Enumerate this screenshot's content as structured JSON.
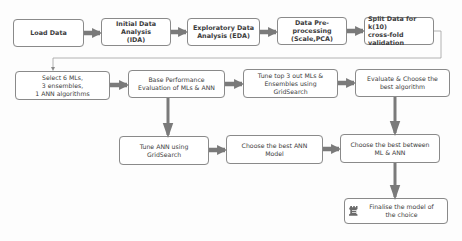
{
  "diagram": {
    "type": "flowchart",
    "colors": {
      "box_border": "#8a8a8a",
      "box_fill": "#ffffff",
      "arrow": "#7a7a7a",
      "connector": "#a0a0a0",
      "text": "#3c3c3c"
    },
    "nodes": [
      {
        "id": "load_data",
        "label": "Load Data"
      },
      {
        "id": "ida",
        "label": "Initial Data Analysis\n(IDA)"
      },
      {
        "id": "eda",
        "label": "Exploratory Data\nAnalysis (EDA)"
      },
      {
        "id": "preprocessing",
        "label": "Data Pre-processing\n(Scale,PCA)"
      },
      {
        "id": "split",
        "label": "Split Data for k(10)\ncross-fold validation"
      },
      {
        "id": "select",
        "label": "Select 6 MLs,\n3 ensembles,\n1 ANN algorithms"
      },
      {
        "id": "base_perf",
        "label": "Base Performance\nEvaluation of MLs & ANN"
      },
      {
        "id": "tune_top3",
        "label": "Tune top 3 out MLs &\nEnsembles using GridSearch"
      },
      {
        "id": "evaluate",
        "label": "Evaluate & Choose the\nbest algorithm"
      },
      {
        "id": "tune_ann",
        "label": "Tune ANN using\nGridSearch"
      },
      {
        "id": "choose_ann",
        "label": "Choose the best ANN\nModel"
      },
      {
        "id": "choose_between",
        "label": "Choose the best between\nML & ANN"
      },
      {
        "id": "finalise",
        "label": "Finalise the model of\nthe choice",
        "icon": "chess-rook-icon"
      }
    ],
    "edges": [
      {
        "from": "load_data",
        "to": "ida"
      },
      {
        "from": "ida",
        "to": "eda"
      },
      {
        "from": "eda",
        "to": "preprocessing"
      },
      {
        "from": "preprocessing",
        "to": "split"
      },
      {
        "from": "split",
        "to": "select"
      },
      {
        "from": "select",
        "to": "base_perf"
      },
      {
        "from": "base_perf",
        "to": "tune_top3"
      },
      {
        "from": "tune_top3",
        "to": "evaluate"
      },
      {
        "from": "base_perf",
        "to": "tune_ann"
      },
      {
        "from": "tune_ann",
        "to": "choose_ann"
      },
      {
        "from": "choose_ann",
        "to": "choose_between"
      },
      {
        "from": "evaluate",
        "to": "choose_between"
      },
      {
        "from": "choose_between",
        "to": "finalise"
      }
    ]
  }
}
